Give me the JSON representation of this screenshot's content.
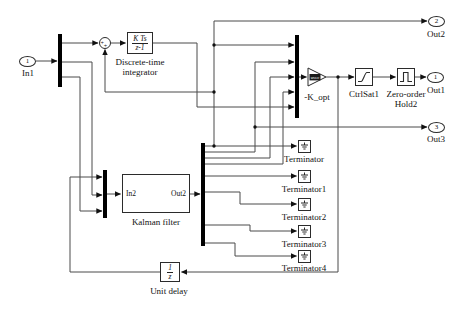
{
  "ports": {
    "in1": {
      "num": "1",
      "label": "In1"
    },
    "out1": {
      "num": "1",
      "label": "Out1"
    },
    "out2": {
      "num": "2",
      "label": "Out2"
    },
    "out3": {
      "num": "3",
      "label": "Out3"
    }
  },
  "sum": {
    "sign_left": "+",
    "sign_bottom": "+"
  },
  "integrator": {
    "label": "Discrete-time integrator",
    "icon_num": "K Ts",
    "icon_den": "z-1"
  },
  "gain": {
    "label": "-K_opt",
    "icon_text": "uvec"
  },
  "saturation": {
    "label": "CtrlSat1"
  },
  "zoh": {
    "label": "Zero-order Hold2"
  },
  "kalman": {
    "label": "Kalman filter",
    "port_in": "In2",
    "port_out": "Out2"
  },
  "unit_delay": {
    "label": "Unit delay",
    "icon_num": "1",
    "icon_den": "z"
  },
  "terminators": [
    {
      "label": "Terminator"
    },
    {
      "label": "Terminator1"
    },
    {
      "label": "Terminator2"
    },
    {
      "label": "Terminator3"
    },
    {
      "label": "Terminator4"
    }
  ],
  "colors": {
    "wire": "#4a4a4a",
    "bar": "#000000",
    "border": "#2b2b2b"
  }
}
